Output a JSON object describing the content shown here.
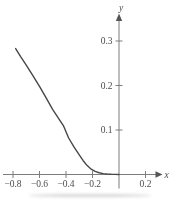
{
  "figure": {
    "background": "#ffffff"
  },
  "chart_data": {
    "type": "line",
    "title": "",
    "xlabel": "x",
    "ylabel": "y",
    "xlim": [
      -0.875,
      0.33
    ],
    "ylim": [
      0,
      0.355
    ],
    "grid": false,
    "legend": false,
    "x_ticks": [
      -0.8,
      -0.6,
      -0.4,
      -0.2,
      0.2
    ],
    "x_tick_labels": [
      "−0.8",
      "−0.6",
      "−0.4",
      "−0.2",
      "0.2"
    ],
    "y_ticks": [
      0.1,
      0.2,
      0.3
    ],
    "y_tick_labels": [
      "0.1",
      "0.2",
      "0.3"
    ],
    "series": [
      {
        "name": "curve",
        "points": [
          [
            -0.78,
            0.283
          ],
          [
            -0.74,
            0.264
          ],
          [
            -0.7,
            0.246
          ],
          [
            -0.65,
            0.222
          ],
          [
            -0.6,
            0.198
          ],
          [
            -0.55,
            0.172
          ],
          [
            -0.5,
            0.146
          ],
          [
            -0.46,
            0.128
          ],
          [
            -0.42,
            0.11
          ],
          [
            -0.38,
            0.082
          ],
          [
            -0.34,
            0.062
          ],
          [
            -0.3,
            0.044
          ],
          [
            -0.27,
            0.031
          ],
          [
            -0.24,
            0.02
          ],
          [
            -0.21,
            0.012
          ],
          [
            -0.18,
            0.007
          ],
          [
            -0.15,
            0.004
          ],
          [
            -0.12,
            0.002
          ],
          [
            -0.09,
            0.001
          ],
          [
            -0.06,
            0.0005
          ],
          [
            -0.03,
            0.0002
          ],
          [
            0,
            0
          ]
        ]
      }
    ],
    "colors": {
      "curve": "#474747",
      "axis": "#7d7d7d",
      "labels": "#3a3a3a",
      "background": "#ffffff",
      "scan_artifact": "#b5b5b5"
    }
  }
}
